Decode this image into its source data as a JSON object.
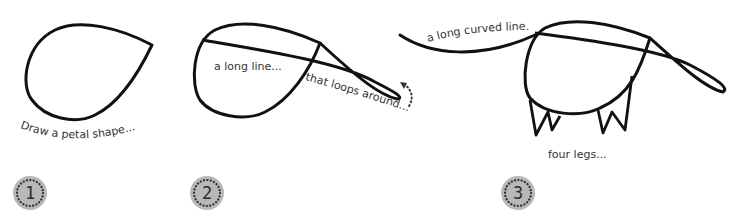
{
  "tutorial": {
    "subject": "anteater",
    "colors": {
      "line": "#111111",
      "text": "#333333",
      "badge_fill": "#b8b8b8",
      "badge_dots": "#2b2b2b"
    },
    "steps": [
      {
        "number": "1",
        "labels": [
          "Draw a petal shape..."
        ]
      },
      {
        "number": "2",
        "labels": [
          "a long line...",
          "that loops around..."
        ]
      },
      {
        "number": "3",
        "labels": [
          "a long curved line...",
          "four legs..."
        ]
      }
    ]
  }
}
